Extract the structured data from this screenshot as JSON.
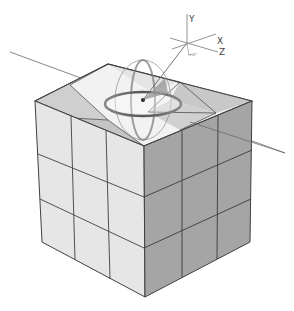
{
  "scene": {
    "description": "3x3x3 cube with rotation gizmo on top face",
    "colors": {
      "background": "#ffffff",
      "left_face": "#e6e6e6",
      "right_face": "#a3a3a3",
      "top_face": "#f2f2f2",
      "top_shade_light": "#dcdcdc",
      "top_shade_dark": "#b8b8b8",
      "edge": "#404040",
      "line": "#707070"
    }
  },
  "axis_gizmo": {
    "y_label": "Y",
    "x_label": "X",
    "z_label": "Z",
    "angle_label": "+0°"
  }
}
